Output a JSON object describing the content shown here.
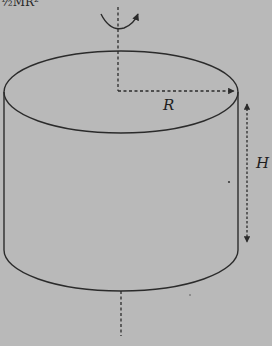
{
  "figure": {
    "type": "rotating-cylinder-diagram",
    "caption_fragment": "½MR²",
    "labels": {
      "radius": "R",
      "height": "H"
    },
    "colors": {
      "background": "#b9b9b9",
      "stroke": "#2b2b2b",
      "label": "#1e1e1e"
    }
  }
}
